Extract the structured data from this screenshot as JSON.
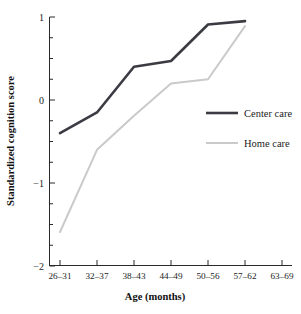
{
  "chart_data": {
    "type": "line",
    "title": "",
    "xlabel": "Age (months)",
    "ylabel": "Standardized cognition score",
    "categories": [
      "26–31",
      "32–37",
      "38–43",
      "44–49",
      "50–56",
      "57–62",
      "63–69"
    ],
    "ylim": [
      -2,
      1
    ],
    "yticks": [
      1,
      0,
      -1,
      -2
    ],
    "ytick_labels": [
      "1",
      "0",
      "−1",
      "−2"
    ],
    "yminor_step": 0.25,
    "grid": false,
    "legend_position": "right-inside",
    "series": [
      {
        "name": "Center care",
        "color": "#3b3b43",
        "width": 2.6,
        "values": [
          -0.4,
          -0.15,
          0.4,
          0.47,
          0.91,
          0.95,
          null
        ]
      },
      {
        "name": "Home care",
        "color": "#cacaca",
        "width": 2.0,
        "values": [
          -1.59,
          -0.6,
          -0.19,
          0.2,
          0.25,
          0.89,
          null
        ]
      }
    ]
  },
  "legend": {
    "items": [
      {
        "label": "Center care",
        "color": "#3b3b43",
        "width": 2.6
      },
      {
        "label": "Home care",
        "color": "#cacaca",
        "width": 2.0
      }
    ]
  },
  "axes": {
    "x_title": "Age (months)",
    "y_title": "Standardized cognition score"
  }
}
